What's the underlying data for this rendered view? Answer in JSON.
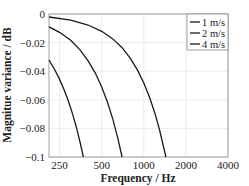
{
  "chart_data": {
    "type": "line",
    "title": "",
    "xlabel": "Frequency / Hz",
    "ylabel": "Magnitue variance / dB",
    "xscale": "log",
    "xlim": [
      210,
      4000
    ],
    "ylim": [
      -0.1,
      0
    ],
    "xticks": [
      250,
      500,
      1000,
      2000,
      4000
    ],
    "xtick_labels": [
      "250",
      "500",
      "1000",
      "2000",
      "4000"
    ],
    "yticks": [
      0,
      -0.02,
      -0.04,
      -0.06,
      -0.08,
      -0.1
    ],
    "ytick_labels": [
      "0",
      "−0.02",
      "−0.04",
      "−0.06",
      "−0.08",
      "−0.1"
    ],
    "grid": true,
    "legend_position": "upper right",
    "series": [
      {
        "name": "1 m/s",
        "color": "#1a1a1a",
        "x": [
          210,
          300,
          400,
          500,
          600,
          700,
          800,
          900,
          1000,
          1100,
          1200,
          1300,
          1440
        ],
        "y": [
          -0.0021,
          -0.0043,
          -0.0077,
          -0.0121,
          -0.0174,
          -0.0236,
          -0.0309,
          -0.0391,
          -0.0482,
          -0.0584,
          -0.0694,
          -0.0815,
          -0.1
        ]
      },
      {
        "name": "2 m/s",
        "color": "#1a1a1a",
        "x": [
          210,
          250,
          300,
          350,
          400,
          450,
          500,
          550,
          600,
          650,
          700
        ],
        "y": [
          -0.009,
          -0.0128,
          -0.0184,
          -0.025,
          -0.0327,
          -0.0413,
          -0.051,
          -0.0617,
          -0.0735,
          -0.0862,
          -0.1
        ]
      },
      {
        "name": "4 m/s",
        "color": "#1a1a1a",
        "x": [
          210,
          230,
          250,
          270,
          290,
          310,
          330,
          350,
          370
        ],
        "y": [
          -0.0322,
          -0.0386,
          -0.0457,
          -0.0533,
          -0.0614,
          -0.0702,
          -0.0795,
          -0.0895,
          -0.1
        ]
      }
    ]
  }
}
